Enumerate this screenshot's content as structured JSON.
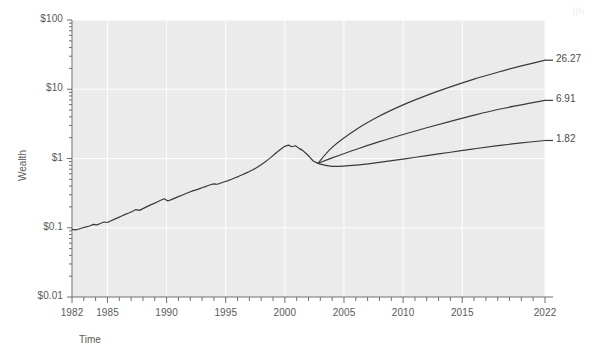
{
  "chart_data": {
    "type": "line",
    "title": "",
    "xlabel": "Time",
    "ylabel": "Wealth",
    "log_y": true,
    "grid": true,
    "legend_position": "none",
    "xlim": [
      1982,
      2022
    ],
    "ylim": [
      0.01,
      100
    ],
    "x_ticks": [
      1982,
      1985,
      1990,
      1995,
      2000,
      2005,
      2010,
      2015,
      2022
    ],
    "x_tick_labels": [
      "1982",
      "1985",
      "1990",
      "1995",
      "2000",
      "2005",
      "2010",
      "2015",
      "2022"
    ],
    "y_ticks": [
      0.01,
      0.1,
      1,
      10,
      100
    ],
    "y_tick_labels": [
      "$0.01",
      "$0.1",
      "$1",
      "$10",
      "$100"
    ],
    "branch_year": 2002.8,
    "branch_value": 0.85,
    "series": [
      {
        "name": "historical-wealth",
        "kind": "historical",
        "x": [
          1982.0,
          1982.3,
          1982.6,
          1982.9,
          1983.2,
          1983.5,
          1983.8,
          1984.1,
          1984.4,
          1984.7,
          1985.0,
          1985.3,
          1985.6,
          1985.9,
          1986.2,
          1986.5,
          1986.8,
          1987.1,
          1987.4,
          1987.7,
          1988.0,
          1988.3,
          1988.6,
          1988.9,
          1989.2,
          1989.5,
          1989.8,
          1990.1,
          1990.4,
          1990.7,
          1991.0,
          1991.3,
          1991.6,
          1991.9,
          1992.2,
          1992.5,
          1992.8,
          1993.1,
          1993.4,
          1993.7,
          1994.0,
          1994.3,
          1994.6,
          1994.9,
          1995.2,
          1995.5,
          1995.8,
          1996.1,
          1996.4,
          1996.7,
          1997.0,
          1997.3,
          1997.6,
          1997.9,
          1998.2,
          1998.5,
          1998.8,
          1999.1,
          1999.4,
          1999.7,
          2000.0,
          2000.3,
          2000.6,
          2000.9,
          2001.2,
          2001.5,
          2001.8,
          2002.1,
          2002.4,
          2002.8
        ],
        "y": [
          0.095,
          0.093,
          0.096,
          0.1,
          0.103,
          0.106,
          0.112,
          0.11,
          0.115,
          0.121,
          0.119,
          0.126,
          0.133,
          0.14,
          0.148,
          0.156,
          0.163,
          0.172,
          0.183,
          0.178,
          0.189,
          0.2,
          0.212,
          0.223,
          0.236,
          0.249,
          0.262,
          0.243,
          0.255,
          0.268,
          0.281,
          0.295,
          0.31,
          0.326,
          0.341,
          0.352,
          0.368,
          0.385,
          0.4,
          0.418,
          0.43,
          0.425,
          0.443,
          0.462,
          0.48,
          0.502,
          0.527,
          0.553,
          0.583,
          0.615,
          0.65,
          0.69,
          0.735,
          0.79,
          0.86,
          0.94,
          1.03,
          1.14,
          1.26,
          1.38,
          1.5,
          1.56,
          1.48,
          1.53,
          1.4,
          1.31,
          1.18,
          1.05,
          0.92,
          0.85
        ]
      },
      {
        "name": "projection-upper",
        "kind": "projection",
        "end_label": "26.27",
        "end_value": 26.27,
        "x": [
          2002.8,
          2004,
          2006,
          2008,
          2010,
          2012,
          2014,
          2016,
          2018,
          2020,
          2022
        ],
        "y": [
          0.85,
          1.45,
          2.6,
          4.1,
          5.95,
          8.15,
          10.8,
          14.0,
          17.6,
          21.7,
          26.27
        ]
      },
      {
        "name": "projection-middle",
        "kind": "projection",
        "end_label": "6.91",
        "end_value": 6.91,
        "x": [
          2002.8,
          2004,
          2006,
          2008,
          2010,
          2012,
          2014,
          2016,
          2018,
          2020,
          2022
        ],
        "y": [
          0.85,
          1.02,
          1.35,
          1.75,
          2.22,
          2.78,
          3.44,
          4.22,
          5.1,
          5.95,
          6.91
        ]
      },
      {
        "name": "projection-lower",
        "kind": "projection",
        "end_label": "1.82",
        "end_value": 1.82,
        "x": [
          2002.8,
          2004,
          2006,
          2008,
          2010,
          2012,
          2014,
          2016,
          2018,
          2020,
          2022
        ],
        "y": [
          0.85,
          0.77,
          0.8,
          0.88,
          0.98,
          1.1,
          1.23,
          1.38,
          1.53,
          1.68,
          1.82
        ]
      }
    ]
  },
  "colors": {
    "plot_background": "#ebebeb",
    "gridline": "#fdfdfd",
    "line": "#3a3a3a",
    "axis": "#6e6e6e",
    "text": "#5a5a5a",
    "page_background": "#ffffff"
  },
  "end_labels": {
    "upper": "26.27",
    "middle": "6.91",
    "lower": "1.82"
  }
}
